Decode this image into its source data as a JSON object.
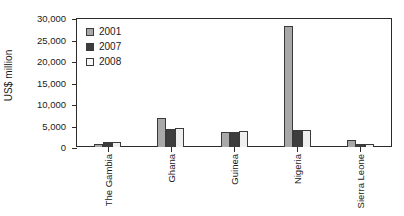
{
  "chart_data": {
    "type": "bar",
    "title": "",
    "xlabel": "",
    "ylabel": "US$ million",
    "ylim": [
      0,
      30000
    ],
    "ytick_labels": [
      "30,000",
      "25,000",
      "20,000",
      "15,000",
      "10,000",
      "5,000",
      "0"
    ],
    "ytick_values": [
      30000,
      25000,
      20000,
      15000,
      10000,
      5000,
      0
    ],
    "grid": false,
    "legend_position": "top-left-inside",
    "categories": [
      "The Gambia",
      "Ghana",
      "Guinea",
      "Nigeria",
      "Sierra Leone"
    ],
    "series": [
      {
        "name": "2001",
        "color": "#a8a8a8",
        "values": [
          800,
          6700,
          3400,
          28200,
          1700
        ]
      },
      {
        "name": "2007",
        "color": "#3d3d3d",
        "values": [
          1100,
          4200,
          3600,
          4000,
          800
        ]
      },
      {
        "name": "2008",
        "color": "#efefef",
        "values": [
          1150,
          4400,
          3700,
          4000,
          700
        ]
      }
    ]
  },
  "axis": {
    "frame_color": "#2b2b2b"
  }
}
